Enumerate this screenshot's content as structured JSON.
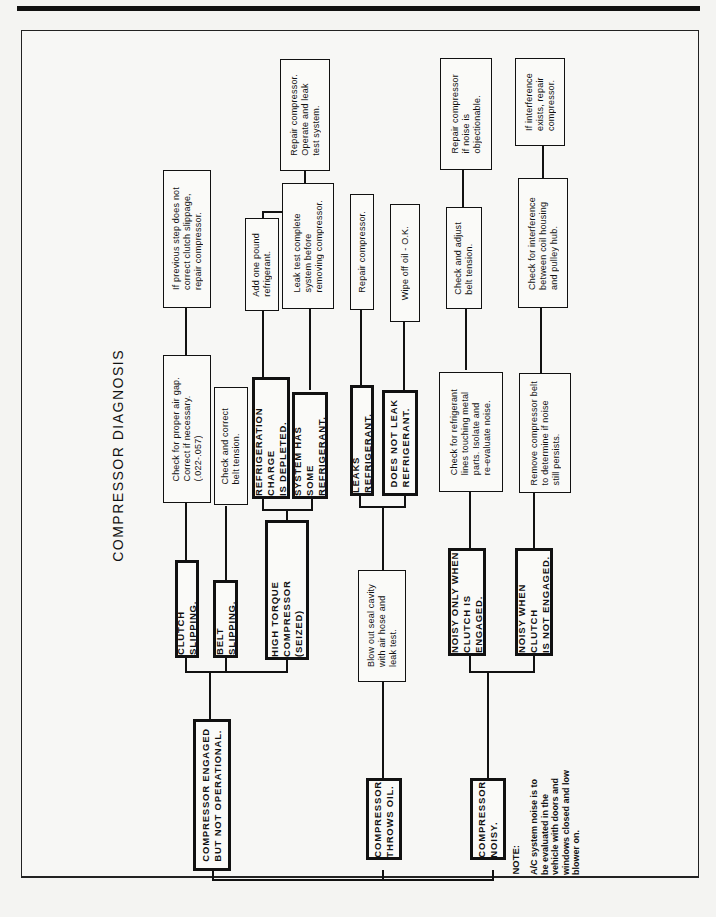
{
  "title": "COMPRESSOR DIAGNOSIS",
  "boxes": {
    "engaged_not_operational": "COMPRESSOR ENGAGED\nBUT NOT OPERATIONAL.",
    "throws_oil": "COMPRESSOR\nTHROWS OIL.",
    "noisy": "COMPRESSOR\nNOISY.",
    "clutch_slipping": "CLUTCH SLIPPING.",
    "belt_slipping": "BELT SLIPPING.",
    "high_torque": "HIGH TORQUE COMPRESSOR\n(SEIZED)",
    "check_air_gap": "Check for proper air gap.\nCorrect if necessary.\n(.022-.057)",
    "check_belt_tension": "Check and correct\nbelt tension.",
    "previous_step": "If previous step does not\ncorrect clutch slippage,\nrepair compressor.",
    "charge_depleted": "REFRIGERATION CHARGE\nIS DEPLETED.",
    "has_some_refrigerant": "SYSTEM HAS SOME\nREFRIGERANT.",
    "add_one_pound": "Add one pound\nrefrigerant.",
    "leak_test_complete": "Leak test complete\nsystem before\nremoving compressor.",
    "repair_operate_leak": "Repair compressor.\nOperate and leak\ntest system.",
    "blow_out_seal": "Blow out seal cavity\nwith air hose and\nleak test.",
    "leaks_refrigerant": "LEAKS REFRIGERANT.",
    "does_not_leak": "DOES NOT LEAK\nREFRIGERANT.",
    "repair_compressor": "Repair compressor.",
    "wipe_off_oil": "Wipe off oil - O.K.",
    "noisy_engaged": "NOISY ONLY WHEN\nCLUTCH IS ENGAGED.",
    "noisy_not_engaged": "NOISY WHEN CLUTCH\nIS NOT ENGAGED.",
    "check_refrigerant_lines": "Check for refrigerant\nlines touching metal\nparts. Isolate and\nre-evaluate noise.",
    "remove_belt": "Remove compressor belt\nto determine if noise\nstill persists.",
    "check_adjust_belt": "Check and adjust\nbelt tension.",
    "repair_if_objectionable": "Repair compressor\nif noise is\nobjectionable.",
    "check_interference": "Check for interference\nbetween coil housing\nand pulley hub.",
    "if_interference": "If interference\nexists, repair\ncompressor."
  },
  "note": {
    "label": "NOTE:",
    "text": "A/C system noise is to\nbe evaluated in the\nvehicle with doors and\nwindows closed and low\nblower on."
  }
}
